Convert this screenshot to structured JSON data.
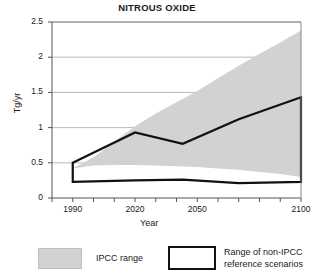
{
  "chart_data": {
    "type": "area",
    "title": "NITROUS OXIDE",
    "xlabel": "Year",
    "ylabel": "Tg/yr",
    "xlim": [
      1980,
      2100
    ],
    "ylim": [
      0,
      2.5
    ],
    "grid": true,
    "y_ticks": [
      "0",
      "0.5",
      "1",
      "1.5",
      "2",
      "2.5"
    ],
    "y_tick_values": [
      0,
      0.5,
      1,
      1.5,
      2,
      2.5
    ],
    "x_ticks": [
      "1990",
      "2020",
      "2050",
      "2100"
    ],
    "x_tick_values": [
      1990,
      2020,
      2050,
      2100
    ],
    "x_minor_step": 10,
    "legend_position": "below",
    "series": [
      {
        "name": "IPCC range",
        "kind": "band",
        "fill": "#d2d2d2",
        "x": [
          1990,
          2000,
          2010,
          2020,
          2030,
          2040,
          2050,
          2060,
          2070,
          2080,
          2090,
          2100
        ],
        "upper": [
          0.42,
          0.58,
          0.8,
          1.02,
          1.2,
          1.36,
          1.52,
          1.7,
          1.88,
          2.05,
          2.21,
          2.38
        ],
        "lower": [
          0.42,
          0.46,
          0.47,
          0.47,
          0.46,
          0.45,
          0.44,
          0.42,
          0.4,
          0.37,
          0.34,
          0.3
        ]
      },
      {
        "name": "Range of non-IPCC reference scenarios",
        "kind": "outline",
        "stroke": "#111111",
        "x": [
          1990,
          2020,
          2043,
          2070,
          2100
        ],
        "upper": [
          0.5,
          0.93,
          0.77,
          1.12,
          1.43
        ],
        "lower": [
          0.23,
          0.25,
          0.26,
          0.21,
          0.23
        ]
      }
    ]
  },
  "axes": {
    "title": "NITROUS OXIDE",
    "ylabel": "Tg/yr",
    "xlabel": "Year"
  },
  "legend": {
    "items": [
      {
        "label": "IPCC range",
        "swatch": "gray-fill-swatch"
      },
      {
        "label_line1": "Range of non-IPCC",
        "label_line2": "reference scenarios",
        "swatch": "black-outline-swatch"
      }
    ]
  },
  "colors": {
    "band_fill": "#d2d2d2",
    "outline": "#111111",
    "grid": "#a8a8a8",
    "axis": "#555555",
    "text": "#1a1a1a"
  }
}
